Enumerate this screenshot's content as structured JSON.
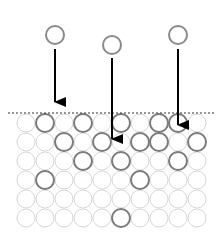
{
  "diagram": {
    "title": "",
    "colors": {
      "background": "#ffffff",
      "grid_circle": "#d6d6d6",
      "highlight_circle": "#7a7a7a",
      "falling_circle": "#8a8a8a",
      "arrow": "#000000",
      "dashed_line": "#333333"
    },
    "grid": {
      "rows": 6,
      "cols": 10,
      "origin_x": 26,
      "origin_y": 123,
      "spacing": 19,
      "radius": 9,
      "highlighted": [
        [
          0,
          1
        ],
        [
          0,
          3
        ],
        [
          0,
          5
        ],
        [
          0,
          7
        ],
        [
          0,
          8
        ],
        [
          1,
          2
        ],
        [
          1,
          4
        ],
        [
          1,
          6
        ],
        [
          1,
          7
        ],
        [
          1,
          9
        ],
        [
          2,
          3
        ],
        [
          2,
          5
        ],
        [
          2,
          8
        ],
        [
          3,
          1
        ],
        [
          3,
          6
        ],
        [
          5,
          5
        ]
      ]
    },
    "surface_line": {
      "y": 113,
      "x1": 8,
      "x2": 215
    },
    "falling": [
      {
        "cx": 55,
        "cy": 35,
        "r": 9,
        "arrow_x": 55,
        "arrow_y1": 49,
        "arrow_y2": 113
      },
      {
        "cx": 112,
        "cy": 45,
        "r": 9,
        "arrow_x": 112,
        "arrow_y1": 58,
        "arrow_y2": 150
      },
      {
        "cx": 178,
        "cy": 35,
        "r": 9,
        "arrow_x": 178,
        "arrow_y1": 49,
        "arrow_y2": 136
      }
    ]
  }
}
